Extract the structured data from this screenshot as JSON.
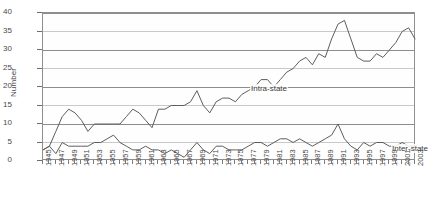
{
  "chart_data": {
    "type": "line",
    "title": "",
    "xlabel": "",
    "ylabel": "Number",
    "ylim": [
      0,
      40
    ],
    "ytick_step": 5,
    "yticks": [
      0,
      5,
      10,
      15,
      20,
      25,
      30,
      35,
      40
    ],
    "grid": true,
    "legend_position": "inline-annotation",
    "x_tick_rotation": 90,
    "x_tick_interval": 2,
    "x": [
      1945,
      1946,
      1947,
      1948,
      1949,
      1950,
      1951,
      1952,
      1953,
      1954,
      1955,
      1956,
      1957,
      1958,
      1959,
      1960,
      1961,
      1962,
      1963,
      1964,
      1965,
      1966,
      1967,
      1968,
      1969,
      1970,
      1971,
      1972,
      1973,
      1974,
      1975,
      1976,
      1977,
      1978,
      1979,
      1980,
      1981,
      1982,
      1983,
      1984,
      1985,
      1986,
      1987,
      1988,
      1989,
      1990,
      1991,
      1992,
      1993,
      1994,
      1995,
      1996,
      1997,
      1998,
      1999,
      2000,
      2001,
      2002,
      2003
    ],
    "xtick_labels": [
      "1945",
      "1947",
      "1949",
      "1951",
      "1953",
      "1955",
      "1957",
      "1959",
      "1961",
      "1963",
      "1965",
      "1967",
      "1969",
      "1971",
      "1973",
      "1975",
      "1977",
      "1979",
      "1981",
      "1983",
      "1985",
      "1987",
      "1989",
      "1991",
      "1993",
      "1995",
      "1997",
      "1999",
      "2001",
      "2003"
    ],
    "series": [
      {
        "name": "Intra-state",
        "color": "#5d5d5d",
        "values": [
          3,
          4,
          8,
          12,
          14,
          13,
          11,
          8,
          10,
          10,
          10,
          10,
          10,
          12,
          14,
          13,
          11,
          9,
          14,
          14,
          15,
          15,
          15,
          16,
          19,
          15,
          13,
          16,
          17,
          17,
          16,
          18,
          19,
          20,
          22,
          22,
          20,
          22,
          24,
          25,
          27,
          28,
          26,
          29,
          28,
          33,
          37,
          38,
          33,
          28,
          27,
          27,
          29,
          28,
          30,
          32,
          35,
          36,
          33
        ]
      },
      {
        "name": "Inter-state",
        "color": "#5d5d5d",
        "values": [
          3,
          4,
          2,
          5,
          4,
          4,
          4,
          4,
          5,
          5,
          6,
          7,
          5,
          4,
          3,
          3,
          4,
          3,
          3,
          2,
          3,
          2,
          1,
          3,
          5,
          3,
          2,
          4,
          4,
          3,
          3,
          3,
          4,
          5,
          5,
          4,
          5,
          6,
          6,
          5,
          6,
          5,
          4,
          5,
          6,
          7,
          10,
          6,
          4,
          3,
          5,
          4,
          5,
          5,
          4,
          4,
          5,
          4,
          4
        ]
      }
    ],
    "annotations": [
      {
        "text": "Intra-state",
        "series": "Intra-state"
      },
      {
        "text": "Inter-state",
        "series": "Inter-state"
      }
    ]
  }
}
